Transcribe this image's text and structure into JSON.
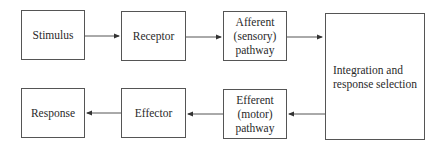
{
  "diagram": {
    "type": "flowchart",
    "nodes": [
      {
        "id": "stimulus",
        "label": "Stimulus"
      },
      {
        "id": "receptor",
        "label": "Receptor"
      },
      {
        "id": "afferent",
        "label": "Afferent\n(sensory)\npathway"
      },
      {
        "id": "integration",
        "label": "Integration and\nresponse selection"
      },
      {
        "id": "efferent",
        "label": "Efferent\n(motor)\npathway"
      },
      {
        "id": "effector",
        "label": "Effector"
      },
      {
        "id": "response",
        "label": "Response"
      }
    ],
    "edges": [
      {
        "from": "stimulus",
        "to": "receptor"
      },
      {
        "from": "receptor",
        "to": "afferent"
      },
      {
        "from": "afferent",
        "to": "integration"
      },
      {
        "from": "integration",
        "to": "efferent"
      },
      {
        "from": "efferent",
        "to": "effector"
      },
      {
        "from": "effector",
        "to": "response"
      }
    ],
    "colors": {
      "line": "#555555",
      "text": "#2a2a2a",
      "background": "#ffffff"
    }
  }
}
